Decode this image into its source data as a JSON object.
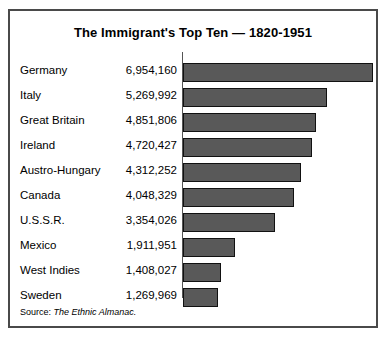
{
  "chart": {
    "title": "The Immigrant's Top Ten — 1820-1951",
    "source_label": "Source:",
    "source_title": "The Ethnic Almanac.",
    "bar_fill_color": "#595959",
    "bar_outline_color": "#111111",
    "frame_color": "#4a4a4a",
    "background_color": "#ffffff"
  },
  "chart_data": {
    "type": "bar",
    "orientation": "horizontal",
    "title": "The Immigrant's Top Ten — 1820-1951",
    "xlabel": "",
    "ylabel": "",
    "grid": false,
    "legend": false,
    "xlim": [
      0,
      6954160
    ],
    "categories": [
      "Germany",
      "Italy",
      "Great Britain",
      "Ireland",
      "Austro-Hungary",
      "Canada",
      "U.S.S.R.",
      "Mexico",
      "West Indies",
      "Sweden"
    ],
    "values": [
      6954160,
      5269992,
      4851806,
      4720427,
      4312252,
      4048329,
      3354026,
      1911951,
      1408027,
      1269969
    ],
    "value_labels": [
      "6,954,160",
      "5,269,992",
      "4,851,806",
      "4,720,427",
      "4,312,252",
      "4,048,329",
      "3,354,026",
      "1,911,951",
      "1,408,027",
      "1,269,969"
    ]
  }
}
